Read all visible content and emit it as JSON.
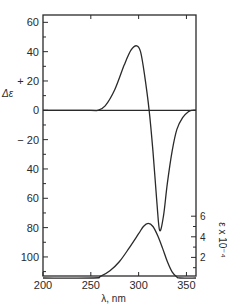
{
  "chart_data": {
    "type": "line",
    "title": "",
    "xlabel": "λ, nm",
    "ylabel": "Δε",
    "y2label": "ε x 10⁻⁴",
    "xlim": [
      200,
      360
    ],
    "ylim": [
      -113,
      65
    ],
    "y2lim": [
      0,
      6.5
    ],
    "grid": false,
    "legend": null,
    "x_ticks": [
      200,
      250,
      300,
      350
    ],
    "x_tick_labels": [
      "200",
      "250",
      "300",
      "350"
    ],
    "y_ticks": [
      60,
      40,
      20,
      0,
      -20,
      -40,
      -60,
      -80,
      -100
    ],
    "y_tick_labels": [
      "60",
      "40",
      "+ 20",
      "0",
      "− 20",
      "40",
      "60",
      "80",
      "100"
    ],
    "y2_ticks": [
      6,
      4,
      2
    ],
    "y2_tick_labels": [
      "6",
      "4",
      "2"
    ],
    "series": [
      {
        "name": "CD (Δε)",
        "axis": "left",
        "x": [
          200,
          250,
          257,
          265,
          275,
          285,
          292,
          298,
          302,
          306,
          311,
          315,
          319,
          322,
          326,
          330,
          335,
          340,
          346,
          352,
          356,
          360
        ],
        "y": [
          0,
          0,
          0,
          3,
          14,
          31,
          41,
          44,
          40,
          25,
          0,
          -28,
          -62,
          -82,
          -72,
          -50,
          -28,
          -13,
          -5,
          -1,
          0,
          0
        ]
      },
      {
        "name": "Absorption (ε x 10⁻⁴)",
        "axis": "right",
        "x": [
          200,
          253,
          260,
          270,
          280,
          290,
          300,
          305,
          310,
          315,
          320,
          325,
          330,
          335,
          340,
          343,
          360
        ],
        "y": [
          0,
          0,
          0.15,
          0.7,
          1.6,
          2.9,
          4.3,
          5.0,
          5.3,
          5.0,
          4.1,
          2.9,
          1.6,
          0.6,
          0.1,
          0,
          0
        ]
      }
    ]
  }
}
